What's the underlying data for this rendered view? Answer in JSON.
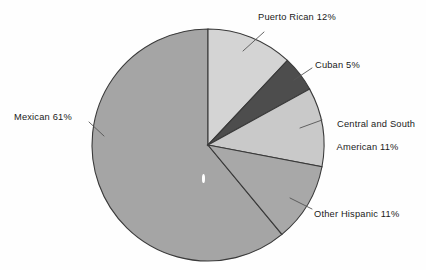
{
  "chart_data": {
    "type": "pie",
    "title": "",
    "categories": [
      "Puerto Rican",
      "Cuban",
      "Central and South American",
      "Other Hispanic",
      "Mexican"
    ],
    "values": [
      12,
      5,
      11,
      11,
      61
    ],
    "units": "percent",
    "start_angle_deg": 0,
    "direction": "clockwise",
    "legend": "none",
    "labels_position": "outside-with-leader-lines",
    "slices": [
      {
        "name": "Puerto Rican",
        "value": 12,
        "label": "Puerto Rican 12%",
        "color": "#d4d4d4",
        "start_deg": 0,
        "end_deg": 43.2
      },
      {
        "name": "Cuban",
        "value": 5,
        "label": "Cuban 5%",
        "color": "#4d4d4d",
        "start_deg": 43.2,
        "end_deg": 61.2
      },
      {
        "name": "Central and South American",
        "value": 11,
        "label_line1": "Central and South",
        "label_line2": "American 11%",
        "color": "#c9c9c9",
        "start_deg": 61.2,
        "end_deg": 100.8
      },
      {
        "name": "Other Hispanic",
        "value": 11,
        "label": "Other Hispanic 11%",
        "color": "#a8a8a8",
        "start_deg": 100.8,
        "end_deg": 140.4
      },
      {
        "name": "Mexican",
        "value": 61,
        "label": "Mexican 61%",
        "color": "#a5a5a5",
        "start_deg": 140.4,
        "end_deg": 360
      }
    ],
    "geometry": {
      "center_x": 208,
      "center_y": 145,
      "radius": 116
    },
    "colors": {
      "background": "#fefefe",
      "outline": "#3a3a3a",
      "text": "#1a1a1a",
      "leader_line": "#555555"
    }
  }
}
